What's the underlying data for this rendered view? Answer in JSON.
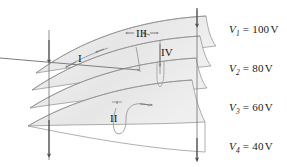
{
  "figure": {
    "background_color": "#ffffff",
    "surface_fill": "#e9e9e9",
    "surface_stroke": "#8a8a8a",
    "line_color": "#6f6f6f",
    "text_color": "#1a1a1a"
  },
  "equipotential_labels": [
    {
      "symbol": "V",
      "subscript": "1",
      "equals": "=",
      "value": "100",
      "unit": "V",
      "full": "V1 = 100 V"
    },
    {
      "symbol": "V",
      "subscript": "2",
      "equals": "=",
      "value": "80",
      "unit": "V",
      "full": "V2 = 80 V"
    },
    {
      "symbol": "V",
      "subscript": "3",
      "equals": "=",
      "value": "60",
      "unit": "V",
      "full": "V3 = 60 V"
    },
    {
      "symbol": "V",
      "subscript": "4",
      "equals": "=",
      "value": "40",
      "unit": "V",
      "full": "V4 = 40 V"
    }
  ],
  "path_labels": [
    {
      "label": "I"
    },
    {
      "label": "II"
    },
    {
      "label": "III"
    },
    {
      "label": "IV"
    }
  ]
}
